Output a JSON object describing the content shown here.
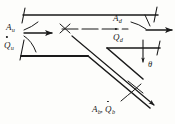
{
  "figure": {
    "kind": "engineering-line-diagram",
    "width_px": 175,
    "height_px": 124,
    "background_color": "#fdfdfb",
    "line_color": "#1a1a1a"
  },
  "labels": {
    "upstream_area": {
      "symbol": "A",
      "subscript": "u"
    },
    "upstream_flow": {
      "symbol": "Q",
      "subscript": "u",
      "has_dot": true
    },
    "downstream_area": {
      "symbol": "A",
      "subscript": "d"
    },
    "downstream_flow": {
      "symbol": "Q",
      "subscript": "d",
      "has_dot": true
    },
    "branch_area": {
      "symbol": "A",
      "subscript": "b"
    },
    "branch_flow": {
      "symbol": "Q",
      "subscript": "b",
      "has_dot": true
    },
    "branch_separator": ",",
    "angle": {
      "symbol": "θ"
    }
  },
  "annotations": {
    "centerline_style": "dashed",
    "upstream_arrow_direction": "right",
    "downstream_arrow_direction": "right",
    "branch_arrow_direction": "down-right"
  }
}
